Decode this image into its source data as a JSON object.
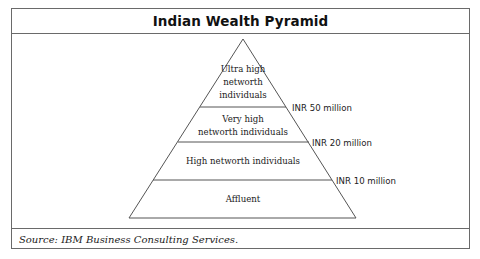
{
  "diagram": {
    "title": "Indian Wealth Pyramid",
    "type": "pyramid",
    "tiers": [
      {
        "label": "Ultra high networth individuals",
        "lines": [
          "Ultra high",
          "networth",
          "individuals"
        ],
        "threshold": "INR 50 million"
      },
      {
        "label": "Very high networth individuals",
        "lines": [
          "Very high",
          "networth individuals"
        ],
        "threshold": "INR 20 million"
      },
      {
        "label": "High networth individuals",
        "lines": [
          "High networth individuals"
        ],
        "threshold": "INR 10 million"
      },
      {
        "label": "Affluent",
        "lines": [
          "Affluent"
        ],
        "threshold": ""
      }
    ],
    "source": "Source: IBM Business Consulting Services.",
    "colors": {
      "border": "#6a6a6a",
      "stroke": "#555555",
      "text": "#222222",
      "background": "#ffffff"
    }
  }
}
